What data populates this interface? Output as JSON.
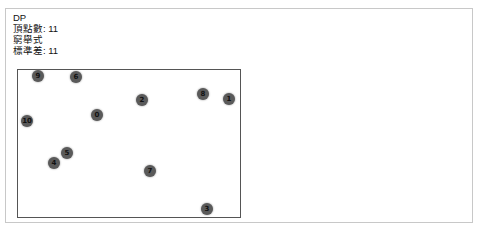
{
  "info": {
    "title": "DP",
    "vertex_count_label": "頂點數: 11",
    "method_label": "窮舉式",
    "std_dev_label": "標準差: 11"
  },
  "graph": {
    "node_color": "#5a5a5a",
    "nodes": [
      {
        "id": "0",
        "x": 97,
        "y": 115
      },
      {
        "id": "1",
        "x": 229,
        "y": 99
      },
      {
        "id": "2",
        "x": 142,
        "y": 100
      },
      {
        "id": "3",
        "x": 207,
        "y": 209
      },
      {
        "id": "4",
        "x": 54,
        "y": 163
      },
      {
        "id": "5",
        "x": 67,
        "y": 153
      },
      {
        "id": "6",
        "x": 76,
        "y": 77
      },
      {
        "id": "7",
        "x": 150,
        "y": 171
      },
      {
        "id": "8",
        "x": 203,
        "y": 94
      },
      {
        "id": "9",
        "x": 38,
        "y": 76
      },
      {
        "id": "10",
        "x": 27,
        "y": 121
      }
    ]
  }
}
